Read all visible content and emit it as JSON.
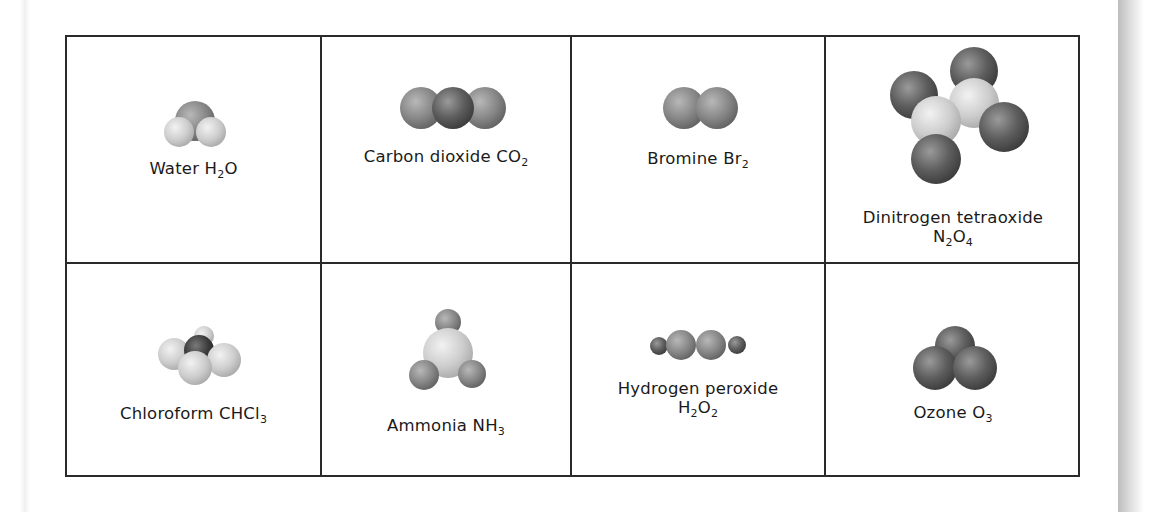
{
  "molecules": [
    {
      "name": "Water",
      "formula_parts": [
        [
          "H",
          ""
        ],
        [
          "2",
          "sub"
        ],
        [
          "O",
          ""
        ]
      ],
      "label": "Water",
      "formula": "H2O",
      "icon": "water-molecule-icon"
    },
    {
      "name": "Carbon dioxide",
      "label": "Carbon dioxide",
      "formula": "CO2",
      "icon": "carbon-dioxide-molecule-icon"
    },
    {
      "name": "Bromine",
      "label": "Bromine",
      "formula": "Br2",
      "icon": "bromine-molecule-icon"
    },
    {
      "name": "Dinitrogen tetraoxide",
      "label": "Dinitrogen tetraoxide",
      "formula": "N2O4",
      "icon": "dinitrogen-tetraoxide-molecule-icon"
    },
    {
      "name": "Chloroform",
      "label": "Chloroform",
      "formula": "CHCl3",
      "icon": "chloroform-molecule-icon"
    },
    {
      "name": "Ammonia",
      "label": "Ammonia",
      "formula": "NH3",
      "icon": "ammonia-molecule-icon"
    },
    {
      "name": "Hydrogen peroxide",
      "label": "Hydrogen peroxide",
      "formula": "H2O2",
      "icon": "hydrogen-peroxide-molecule-icon"
    },
    {
      "name": "Ozone",
      "label": "Ozone",
      "formula": "O3",
      "icon": "ozone-molecule-icon"
    }
  ],
  "formula_display": {
    "water": {
      "a": "H",
      "s1": "2",
      "b": "O"
    },
    "co2": {
      "a": "CO",
      "s1": "2"
    },
    "br2": {
      "a": "Br",
      "s1": "2"
    },
    "n2o4": {
      "a": "N",
      "s1": "2",
      "b": "O",
      "s2": "4"
    },
    "chcl3": {
      "a": "CHCl",
      "s1": "3"
    },
    "nh3": {
      "a": "NH",
      "s1": "3"
    },
    "h2o2": {
      "a": "H",
      "s1": "2",
      "b": "O",
      "s2": "2"
    },
    "o3": {
      "a": "O",
      "s1": "3"
    }
  },
  "colors": {
    "border": "#2a2a2a",
    "text": "#1a1a1a",
    "atom_dark": "#5a5a5a",
    "atom_mid": "#8a8a8a",
    "atom_light": "#cfcfcf"
  }
}
